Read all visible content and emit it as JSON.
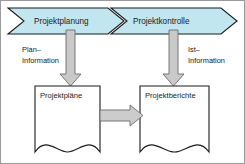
{
  "diagram": {
    "border_color": "#8f8f8f",
    "background_color": "#ffffff",
    "phase_band": {
      "fill_color": "#c2e6f0",
      "stroke_color": "#1a1a1a",
      "phases": [
        {
          "id": "phase-planung",
          "label": "Projektplanung"
        },
        {
          "id": "phase-kontrolle",
          "label": "Projektkontrolle"
        }
      ]
    },
    "flows": [
      {
        "id": "flow-plan",
        "label_line1": "Plan–",
        "label_line2": "Information",
        "icon": "down-arrow-icon"
      },
      {
        "id": "flow-ist",
        "label_line1": "Ist–",
        "label_line2": "Information",
        "icon": "down-arrow-icon"
      }
    ],
    "documents": [
      {
        "id": "doc-projektplaene",
        "label": "Projektpläne"
      },
      {
        "id": "doc-projektberichte",
        "label": "Projektberichte"
      }
    ],
    "connector": {
      "id": "connector-plaene-berichte",
      "icon": "right-arrow-icon",
      "fill_color": "#cccccc",
      "stroke_color": "#6b6b6b"
    },
    "arrow_style": {
      "fill_color": "#c9c9c9",
      "stroke_color": "#6b6b6b"
    },
    "document_style": {
      "fill_color": "#ffffff",
      "stroke_color": "#1a1a1a"
    }
  }
}
